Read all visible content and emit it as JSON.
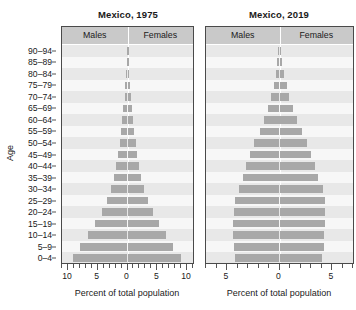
{
  "figure": {
    "y_axis_title": "Age",
    "age_groups": [
      "0–4",
      "5–9",
      "10–14",
      "15–19",
      "20–24",
      "25–29",
      "30–34",
      "35–39",
      "40–44",
      "45–49",
      "50–54",
      "55–59",
      "60–64",
      "65–69",
      "70–74",
      "75–79",
      "80–84",
      "85–89",
      "90–94"
    ]
  },
  "panels": [
    {
      "id": "left",
      "title": "Mexico, 1975",
      "males_label": "Males",
      "females_label": "Females",
      "x_axis_title": "Percent of total population"
    },
    {
      "id": "right",
      "title": "Mexico, 2019",
      "males_label": "Males",
      "females_label": "Females",
      "x_axis_title": "Percent of total population"
    }
  ],
  "chart_data": [
    {
      "type": "bar",
      "subtype": "population-pyramid",
      "title": "Mexico, 1975",
      "xlabel": "Percent of total population",
      "ylabel": "Age",
      "xlim": [
        -11,
        11
      ],
      "xticks": [
        -10,
        -5,
        0,
        5,
        10
      ],
      "xticklabels": [
        "10",
        "5",
        "0",
        "5",
        "10"
      ],
      "minor_tick_step": 1,
      "grid": false,
      "legend_position": "top-inside-band",
      "categories": [
        "0–4",
        "5–9",
        "10–14",
        "15–19",
        "20–24",
        "25–29",
        "30–34",
        "35–39",
        "40–44",
        "45–49",
        "50–54",
        "55–59",
        "60–64",
        "65–69",
        "70–74",
        "75–79",
        "80–84",
        "85–89",
        "90–94"
      ],
      "series": [
        {
          "name": "Males",
          "direction": "left",
          "values": [
            9.2,
            7.9,
            6.6,
            5.4,
            4.3,
            3.4,
            2.7,
            2.2,
            1.9,
            1.6,
            1.3,
            1.1,
            0.9,
            0.7,
            0.5,
            0.35,
            0.2,
            0.12,
            0.06
          ]
        },
        {
          "name": "Females",
          "direction": "right",
          "values": [
            9.0,
            7.7,
            6.5,
            5.3,
            4.3,
            3.4,
            2.7,
            2.2,
            1.9,
            1.6,
            1.35,
            1.1,
            0.95,
            0.75,
            0.55,
            0.4,
            0.24,
            0.14,
            0.08
          ]
        }
      ]
    },
    {
      "type": "bar",
      "subtype": "population-pyramid",
      "title": "Mexico, 2019",
      "xlabel": "Percent of total population",
      "ylabel": "Age",
      "xlim": [
        -7,
        7
      ],
      "xticks": [
        -5,
        0,
        5
      ],
      "xticklabels": [
        "5",
        "0",
        "5"
      ],
      "minor_tick_step": 1,
      "grid": false,
      "legend_position": "top-inside-band",
      "categories": [
        "0–4",
        "5–9",
        "10–14",
        "15–19",
        "20–24",
        "25–29",
        "30–34",
        "35–39",
        "40–44",
        "45–49",
        "50–54",
        "55–59",
        "60–64",
        "65–69",
        "70–74",
        "75–79",
        "80–84",
        "85–89",
        "90–94"
      ],
      "series": [
        {
          "name": "Males",
          "direction": "left",
          "values": [
            4.2,
            4.3,
            4.4,
            4.4,
            4.3,
            4.2,
            3.9,
            3.5,
            3.2,
            2.8,
            2.4,
            1.9,
            1.5,
            1.1,
            0.8,
            0.55,
            0.35,
            0.2,
            0.1
          ]
        },
        {
          "name": "Females",
          "direction": "right",
          "values": [
            4.0,
            4.2,
            4.2,
            4.3,
            4.3,
            4.3,
            4.1,
            3.7,
            3.4,
            3.0,
            2.6,
            2.1,
            1.7,
            1.3,
            0.95,
            0.7,
            0.45,
            0.26,
            0.14
          ]
        }
      ]
    }
  ],
  "colors": {
    "bar": "#a8a8a8",
    "plot_background": "#f0f0f0",
    "band_background": "#c9c9c9",
    "panel_border": "#4a4a4a",
    "text": "#1a1a1a"
  }
}
